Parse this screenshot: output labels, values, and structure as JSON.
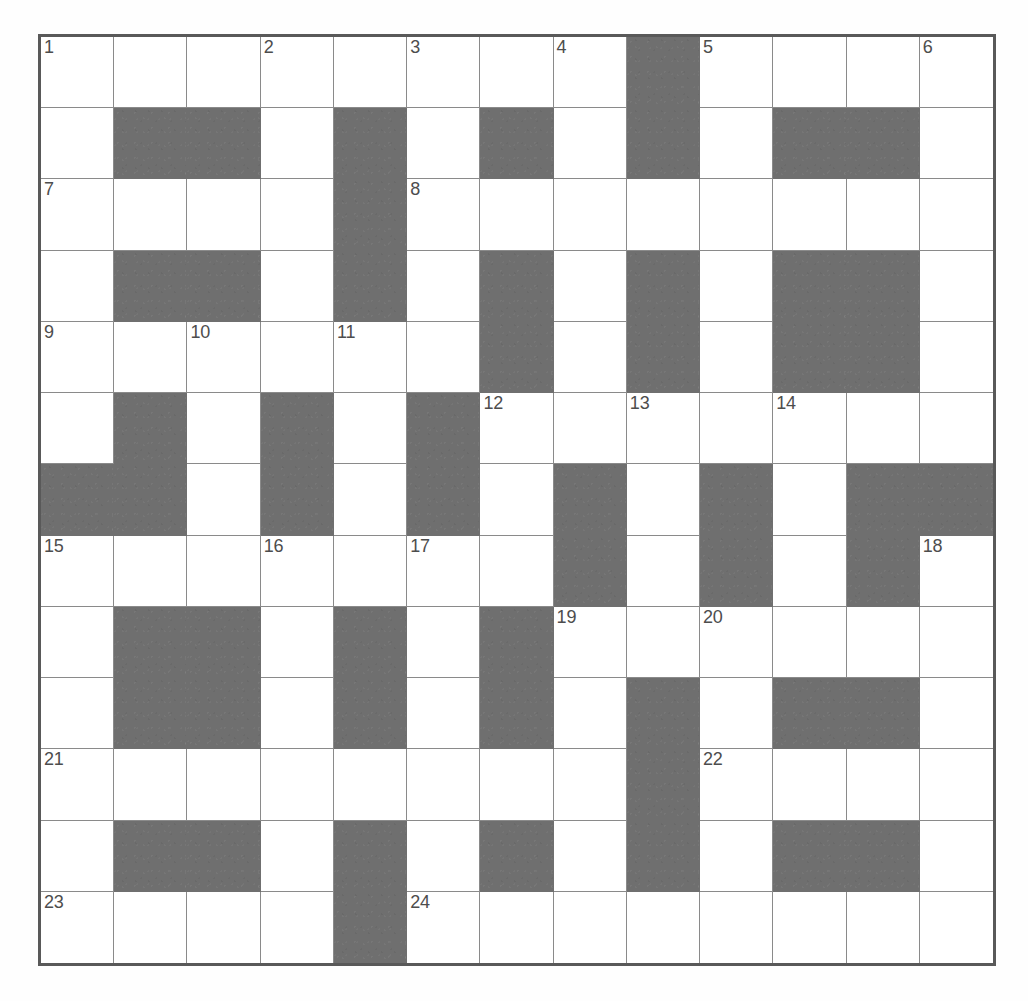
{
  "puzzle": {
    "title": "Crossword Grid",
    "rows": 13,
    "columns": 13,
    "colors": {
      "block": "#6f6f6f",
      "cell": "#ffffff",
      "grid_line": "#8a8a8a",
      "border": "#595959",
      "number_text": "#4d4d4d"
    },
    "numbers_visible": [
      "1",
      "2",
      "3",
      "4",
      "5",
      "6",
      "7",
      "8",
      "9",
      "10",
      "11",
      "12",
      "13",
      "14",
      "15",
      "16",
      "17",
      "18",
      "19",
      "20",
      "21",
      "22",
      "23",
      "24"
    ],
    "grid": [
      [
        0,
        0,
        0,
        0,
        0,
        0,
        0,
        0,
        1,
        0,
        0,
        0,
        0
      ],
      [
        0,
        1,
        1,
        0,
        1,
        0,
        1,
        0,
        1,
        0,
        1,
        1,
        0
      ],
      [
        0,
        0,
        0,
        0,
        1,
        0,
        0,
        0,
        0,
        0,
        0,
        0,
        0
      ],
      [
        0,
        1,
        1,
        0,
        1,
        0,
        1,
        0,
        1,
        0,
        1,
        1,
        0
      ],
      [
        0,
        0,
        0,
        0,
        0,
        0,
        1,
        0,
        1,
        0,
        1,
        1,
        0
      ],
      [
        0,
        1,
        0,
        1,
        0,
        1,
        0,
        0,
        0,
        0,
        0,
        0,
        0
      ],
      [
        1,
        1,
        0,
        1,
        0,
        1,
        0,
        1,
        0,
        1,
        0,
        1,
        1
      ],
      [
        0,
        0,
        0,
        0,
        0,
        0,
        0,
        1,
        0,
        1,
        0,
        1,
        0
      ],
      [
        0,
        1,
        1,
        0,
        1,
        0,
        1,
        0,
        0,
        0,
        0,
        0,
        0
      ],
      [
        0,
        1,
        1,
        0,
        1,
        0,
        1,
        0,
        1,
        0,
        1,
        1,
        0
      ],
      [
        0,
        0,
        0,
        0,
        0,
        0,
        0,
        0,
        1,
        0,
        0,
        0,
        0
      ],
      [
        0,
        1,
        1,
        0,
        1,
        0,
        1,
        0,
        1,
        0,
        1,
        1,
        0
      ],
      [
        0,
        0,
        0,
        0,
        1,
        0,
        0,
        0,
        0,
        0,
        0,
        0,
        0
      ]
    ],
    "clue_numbers": {
      "0_0": "1",
      "0_3": "2",
      "0_5": "3",
      "0_7": "4",
      "0_9": "5",
      "0_12": "6",
      "2_0": "7",
      "2_5": "8",
      "4_0": "9",
      "4_2": "10",
      "4_4": "11",
      "5_6": "12",
      "5_8": "13",
      "5_10": "14",
      "7_0": "15",
      "7_3": "16",
      "7_5": "17",
      "7_12": "18",
      "8_7": "19",
      "8_9": "20",
      "10_0": "21",
      "10_9": "22",
      "12_0": "23",
      "12_5": "24"
    },
    "letters": {}
  }
}
